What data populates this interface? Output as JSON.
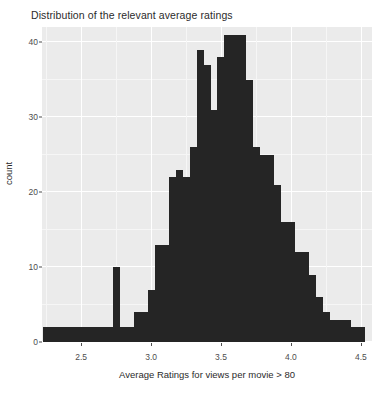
{
  "chart_data": {
    "type": "bar",
    "title": "Distribution of the relevant average ratings",
    "xlabel": "Average Ratings for views per movie > 80",
    "ylabel": "count",
    "xlim": [
      2.22,
      4.58
    ],
    "ylim": [
      0,
      42
    ],
    "grid": true,
    "legend": null,
    "bin_width": 0.05,
    "xticks": [
      2.5,
      3.0,
      3.5,
      4.0,
      4.5
    ],
    "xtick_labels": [
      "2.5",
      "3.0",
      "3.5",
      "4.0",
      "4.5"
    ],
    "yticks": [
      0,
      10,
      20,
      30,
      40
    ],
    "ytick_labels": [
      "0",
      "10",
      "20",
      "30",
      "40"
    ],
    "bar_color": "#252525",
    "panel_color": "#ebebeb",
    "grid_color": "#ffffff",
    "categories": [
      "2.25",
      "2.30",
      "2.35",
      "2.40",
      "2.45",
      "2.50",
      "2.55",
      "2.60",
      "2.65",
      "2.70",
      "2.75",
      "2.80",
      "2.85",
      "2.90",
      "2.95",
      "3.00",
      "3.05",
      "3.10",
      "3.15",
      "3.20",
      "3.25",
      "3.30",
      "3.35",
      "3.40",
      "3.45",
      "3.50",
      "3.55",
      "3.60",
      "3.65",
      "3.70",
      "3.75",
      "3.80",
      "3.85",
      "3.90",
      "3.95",
      "4.00",
      "4.05",
      "4.10",
      "4.15",
      "4.20",
      "4.25",
      "4.30",
      "4.35",
      "4.40",
      "4.45",
      "4.50"
    ],
    "values": [
      2,
      2,
      2,
      2,
      2,
      2,
      2,
      2,
      2,
      2,
      10,
      2,
      2,
      4,
      4,
      7,
      13,
      13,
      22,
      23,
      22,
      26,
      39,
      37,
      31,
      38,
      41,
      41,
      41,
      35,
      26,
      25,
      25,
      21,
      16,
      16,
      12,
      12,
      9,
      6,
      4,
      3,
      3,
      3,
      2,
      2
    ]
  }
}
